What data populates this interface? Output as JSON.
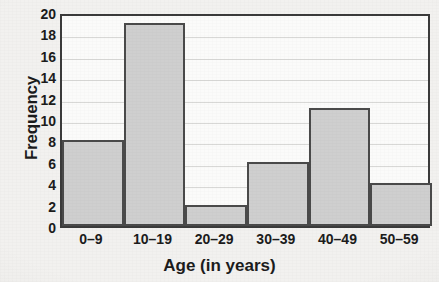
{
  "chart_data": {
    "type": "bar",
    "title": "",
    "title_clipped": true,
    "categories": [
      "0–9",
      "10–19",
      "20–29",
      "30–39",
      "40–49",
      "50–59"
    ],
    "values": [
      8,
      19,
      2,
      6,
      11,
      4
    ],
    "xlabel": "Age (in years)",
    "ylabel": "Frequency",
    "ylim": [
      0,
      20
    ],
    "ytick_step": 2,
    "yticks": [
      0,
      2,
      4,
      6,
      8,
      10,
      12,
      14,
      16,
      18,
      20
    ],
    "ytick_labels": [
      "0",
      "2",
      "4",
      "6",
      "8",
      "10",
      "12",
      "14",
      "16",
      "18",
      "20"
    ],
    "grid": true,
    "grid_axis": "y",
    "legend": false,
    "bar_fill_color": "#cfcfcf",
    "bar_edge_color": "#4a4a4a",
    "plot_background_color": "#fbfbfa",
    "page_background_color": "#f2f1ef",
    "text_color": "#1c1c1c"
  }
}
